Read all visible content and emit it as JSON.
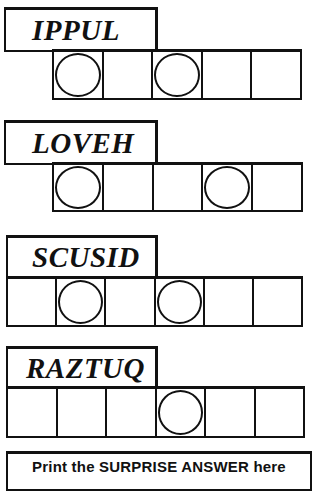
{
  "puzzles": [
    {
      "scrambled_word": "IPPUL",
      "letter_count": 5,
      "circled_positions": [
        1,
        3
      ],
      "cells": [
        {
          "index": 1,
          "circled": true,
          "value": ""
        },
        {
          "index": 2,
          "circled": false,
          "value": ""
        },
        {
          "index": 3,
          "circled": true,
          "value": ""
        },
        {
          "index": 4,
          "circled": false,
          "value": ""
        },
        {
          "index": 5,
          "circled": false,
          "value": ""
        }
      ]
    },
    {
      "scrambled_word": "LOVEH",
      "letter_count": 5,
      "circled_positions": [
        1,
        4
      ],
      "cells": [
        {
          "index": 1,
          "circled": true,
          "value": ""
        },
        {
          "index": 2,
          "circled": false,
          "value": ""
        },
        {
          "index": 3,
          "circled": false,
          "value": ""
        },
        {
          "index": 4,
          "circled": true,
          "value": ""
        },
        {
          "index": 5,
          "circled": false,
          "value": ""
        }
      ]
    },
    {
      "scrambled_word": "SCUSID",
      "letter_count": 6,
      "circled_positions": [
        2,
        4
      ],
      "cells": [
        {
          "index": 1,
          "circled": false,
          "value": ""
        },
        {
          "index": 2,
          "circled": true,
          "value": ""
        },
        {
          "index": 3,
          "circled": false,
          "value": ""
        },
        {
          "index": 4,
          "circled": true,
          "value": ""
        },
        {
          "index": 5,
          "circled": false,
          "value": ""
        },
        {
          "index": 6,
          "circled": false,
          "value": ""
        }
      ]
    },
    {
      "scrambled_word": "RAZTUQ",
      "letter_count": 6,
      "circled_positions": [
        4
      ],
      "cells": [
        {
          "index": 1,
          "circled": false,
          "value": ""
        },
        {
          "index": 2,
          "circled": false,
          "value": ""
        },
        {
          "index": 3,
          "circled": false,
          "value": ""
        },
        {
          "index": 4,
          "circled": true,
          "value": ""
        },
        {
          "index": 5,
          "circled": false,
          "value": ""
        },
        {
          "index": 6,
          "circled": false,
          "value": ""
        }
      ]
    }
  ],
  "answer": {
    "prefix": "Print the ",
    "emphasis": "SURPRISE ANSWER",
    "suffix": " here"
  },
  "colors": {
    "ink": "#111111",
    "paper": "#ffffff"
  }
}
